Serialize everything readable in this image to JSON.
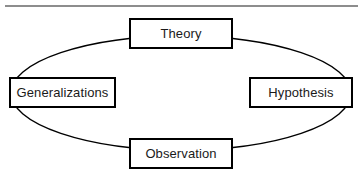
{
  "figure": {
    "background_color": "#ffffff",
    "width": 361,
    "height": 179
  },
  "top_rule": {
    "name": "horizontal-divider",
    "color": "#8d8d8d"
  },
  "cycle": {
    "shape": "ellipse",
    "stroke_color": "#000000",
    "center_x": 181,
    "center_y": 93,
    "radius_x": 170,
    "radius_y": 57
  },
  "nodes": [
    {
      "id": "theory",
      "label": "Theory",
      "position": "top",
      "border_color": "#000000",
      "fill_color": "#ffffff"
    },
    {
      "id": "generalizations",
      "label": "Generalizations",
      "position": "left",
      "border_color": "#000000",
      "fill_color": "#ffffff"
    },
    {
      "id": "hypothesis",
      "label": "Hypothesis",
      "position": "right",
      "border_color": "#000000",
      "fill_color": "#ffffff"
    },
    {
      "id": "observation",
      "label": "Observation",
      "position": "bottom",
      "border_color": "#000000",
      "fill_color": "#ffffff"
    }
  ]
}
